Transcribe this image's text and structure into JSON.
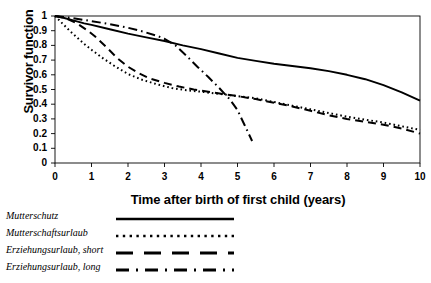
{
  "chart_data": {
    "type": "line",
    "title": "",
    "xlabel": "Time after birth of first child (years)",
    "ylabel": "Survivor function",
    "xlim": [
      0,
      10
    ],
    "ylim": [
      0,
      1
    ],
    "grid": false,
    "legend_position": "below-plot-left",
    "xticks": [
      "0",
      "1",
      "2",
      "3",
      "4",
      "5",
      "6",
      "7",
      "8",
      "9",
      "10"
    ],
    "yticks": [
      "0",
      "0.1",
      "0.2",
      "0.3",
      "0.4",
      "0.5",
      "0.6",
      "0.7",
      "0.8",
      "0.9",
      "1"
    ],
    "series": [
      {
        "name": "Mutterschutz",
        "style": "solid",
        "color": "#000000",
        "x": [
          0,
          0.2,
          0.5,
          0.8,
          1.0,
          1.5,
          2.0,
          2.5,
          3.0,
          3.5,
          4.0,
          4.5,
          5.0,
          5.5,
          6.0,
          6.5,
          7.0,
          7.5,
          8.0,
          8.5,
          9.0,
          9.5,
          10.0
        ],
        "values": [
          1.0,
          0.99,
          0.97,
          0.95,
          0.94,
          0.91,
          0.88,
          0.855,
          0.83,
          0.8,
          0.775,
          0.745,
          0.715,
          0.695,
          0.675,
          0.66,
          0.645,
          0.625,
          0.6,
          0.57,
          0.53,
          0.48,
          0.425
        ]
      },
      {
        "name": "Mutterschaftsurlaub",
        "style": "dotted",
        "color": "#000000",
        "x": [
          0,
          0.2,
          0.4,
          0.6,
          0.8,
          1.0,
          1.3,
          1.6,
          2.0,
          2.4,
          2.8,
          3.2,
          3.6,
          4.0,
          4.5,
          5.0,
          5.5,
          6.0,
          6.5,
          7.0,
          7.5,
          8.0,
          8.5,
          9.0,
          9.5,
          10.0
        ],
        "values": [
          1.0,
          0.95,
          0.9,
          0.855,
          0.81,
          0.77,
          0.715,
          0.665,
          0.605,
          0.565,
          0.535,
          0.51,
          0.495,
          0.485,
          0.47,
          0.455,
          0.44,
          0.415,
          0.39,
          0.365,
          0.34,
          0.315,
          0.295,
          0.275,
          0.25,
          0.225
        ]
      },
      {
        "name": "Erziehungsurlaub, short",
        "style": "dashed",
        "color": "#000000",
        "x": [
          0,
          0.3,
          0.6,
          0.9,
          1.1,
          1.4,
          1.7,
          2.0,
          2.3,
          2.6,
          3.0,
          3.4,
          3.8,
          4.2,
          4.6,
          5.0,
          5.5,
          6.0,
          6.5,
          7.0,
          7.5,
          8.0,
          8.5,
          9.0,
          9.5,
          10.0
        ],
        "values": [
          1.0,
          0.985,
          0.95,
          0.9,
          0.86,
          0.79,
          0.715,
          0.655,
          0.61,
          0.575,
          0.545,
          0.52,
          0.5,
          0.485,
          0.47,
          0.455,
          0.435,
          0.41,
          0.385,
          0.355,
          0.325,
          0.3,
          0.28,
          0.26,
          0.235,
          0.2
        ]
      },
      {
        "name": "Erziehungsurlaub, long",
        "style": "dashdot",
        "color": "#000000",
        "x": [
          0,
          0.5,
          1.0,
          1.5,
          2.0,
          2.4,
          2.8,
          3.0,
          3.3,
          3.6,
          3.9,
          4.2,
          4.5,
          4.8,
          5.0,
          5.2,
          5.4
        ],
        "values": [
          1.0,
          0.985,
          0.965,
          0.945,
          0.92,
          0.895,
          0.865,
          0.845,
          0.8,
          0.73,
          0.655,
          0.585,
          0.51,
          0.43,
          0.36,
          0.255,
          0.15
        ]
      }
    ]
  },
  "legend": {
    "items": [
      {
        "label": "Mutterschutz",
        "style": "solid"
      },
      {
        "label": "Mutterschaftsurlaub",
        "style": "dotted"
      },
      {
        "label": "Erziehungsurlaub, short",
        "style": "dashed"
      },
      {
        "label": "Erziehungsurlaub, long",
        "style": "dashdot"
      }
    ]
  }
}
